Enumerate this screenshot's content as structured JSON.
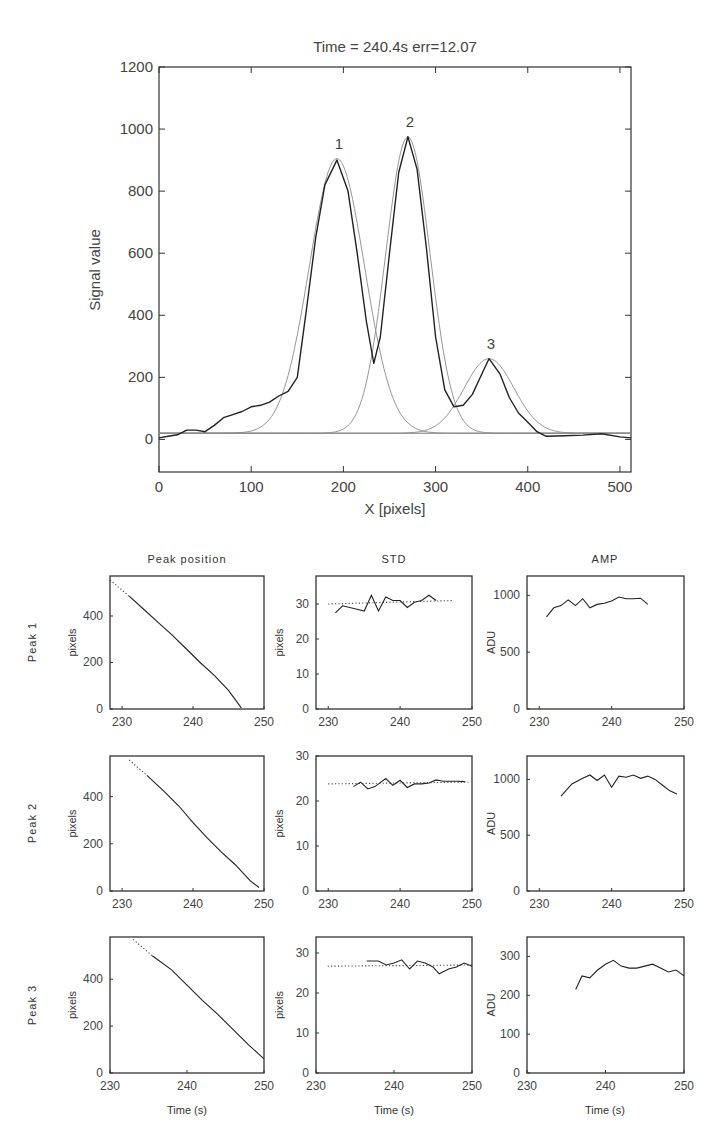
{
  "chart_data": [
    {
      "id": "main",
      "type": "line",
      "title": "Time = 240.4s   err=12.07",
      "xlabel": "X [pixels]",
      "ylabel": "Signal value",
      "xlim": [
        0,
        512
      ],
      "ylim": [
        -105,
        1200
      ],
      "xticks": [
        0,
        100,
        200,
        300,
        400,
        500
      ],
      "yticks": [
        0,
        200,
        400,
        600,
        800,
        1000,
        1200
      ],
      "grid": false,
      "baseline": 20,
      "peaks": [
        {
          "label": "1",
          "center": 193,
          "amplitude": 885,
          "std": 30
        },
        {
          "label": "2",
          "center": 270,
          "amplitude": 955,
          "std": 24
        },
        {
          "label": "3",
          "center": 358,
          "amplitude": 240,
          "std": 27
        }
      ],
      "series": [
        {
          "name": "Measured signal",
          "x": [
            0,
            10,
            20,
            30,
            40,
            50,
            60,
            70,
            80,
            90,
            100,
            110,
            120,
            130,
            140,
            150,
            160,
            170,
            180,
            193,
            205,
            215,
            225,
            233,
            240,
            250,
            260,
            270,
            280,
            290,
            300,
            310,
            320,
            330,
            340,
            350,
            358,
            370,
            380,
            390,
            400,
            410,
            420,
            440,
            460,
            480,
            500,
            512
          ],
          "y": [
            5,
            10,
            15,
            30,
            30,
            25,
            45,
            70,
            80,
            90,
            105,
            110,
            120,
            140,
            155,
            200,
            420,
            650,
            820,
            900,
            800,
            600,
            380,
            245,
            330,
            600,
            860,
            975,
            870,
            620,
            330,
            160,
            105,
            110,
            145,
            210,
            260,
            210,
            135,
            85,
            55,
            25,
            10,
            12,
            14,
            18,
            8,
            5
          ]
        }
      ]
    },
    {
      "id": "r1c1",
      "type": "line",
      "title": "Peak position",
      "row_label": "Peak 1",
      "ylabel": "pixels",
      "xlabel": "",
      "xlim": [
        228.3,
        250
      ],
      "ylim": [
        0,
        572
      ],
      "xticks": [
        230,
        240,
        250
      ],
      "yticks": [
        0,
        200,
        400
      ],
      "series": [
        {
          "name": "dotted",
          "style": "dotted",
          "x": [
            228.3,
            231
          ],
          "y": [
            555,
            485
          ]
        },
        {
          "name": "solid",
          "style": "solid",
          "x": [
            231,
            233,
            235,
            237,
            239,
            241,
            243,
            245,
            246.8
          ],
          "y": [
            485,
            430,
            375,
            320,
            260,
            200,
            145,
            80,
            5
          ]
        }
      ]
    },
    {
      "id": "r1c2",
      "type": "line",
      "title": "STD",
      "ylabel": "pixels",
      "xlabel": "",
      "xlim": [
        228.3,
        250
      ],
      "ylim": [
        0,
        38
      ],
      "xticks": [
        230,
        240,
        250
      ],
      "yticks": [
        0,
        10,
        20,
        30
      ],
      "series": [
        {
          "name": "dotted",
          "style": "dotted",
          "x": [
            230,
            247.5
          ],
          "y": [
            30,
            31
          ]
        },
        {
          "name": "solid",
          "style": "solid",
          "x": [
            231,
            232,
            234,
            235,
            236,
            237,
            238,
            239,
            240,
            241,
            242,
            243,
            244,
            245
          ],
          "y": [
            27.5,
            29.5,
            28.5,
            28,
            32.5,
            28,
            32,
            31,
            31,
            29,
            30.5,
            31,
            32.5,
            31
          ]
        }
      ]
    },
    {
      "id": "r1c3",
      "type": "line",
      "title": "AMP",
      "ylabel": "ADU",
      "xlabel": "",
      "xlim": [
        228.3,
        250
      ],
      "ylim": [
        0,
        1170
      ],
      "xticks": [
        230,
        240,
        250
      ],
      "yticks": [
        0,
        500,
        1000
      ],
      "series": [
        {
          "name": "solid",
          "style": "solid",
          "x": [
            231,
            232,
            233,
            234,
            235,
            236,
            237,
            238,
            239,
            240,
            241,
            242,
            243,
            244,
            245
          ],
          "y": [
            810,
            890,
            910,
            960,
            910,
            970,
            890,
            920,
            930,
            950,
            985,
            970,
            970,
            975,
            920
          ]
        }
      ]
    },
    {
      "id": "r2c1",
      "type": "line",
      "title": "",
      "row_label": "Peak 2",
      "ylabel": "pixels",
      "xlabel": "",
      "xlim": [
        228.3,
        250
      ],
      "ylim": [
        0,
        572
      ],
      "xticks": [
        230,
        240,
        250
      ],
      "yticks": [
        0,
        200,
        400
      ],
      "series": [
        {
          "name": "dotted",
          "style": "dotted",
          "x": [
            231,
            233.5
          ],
          "y": [
            555,
            490
          ]
        },
        {
          "name": "solid",
          "style": "solid",
          "x": [
            233.5,
            236,
            238,
            240,
            242,
            244,
            246,
            248,
            249.3
          ],
          "y": [
            490,
            420,
            360,
            290,
            225,
            165,
            110,
            45,
            15
          ]
        }
      ]
    },
    {
      "id": "r2c2",
      "type": "line",
      "title": "",
      "ylabel": "pixels",
      "xlabel": "",
      "xlim": [
        228.3,
        250
      ],
      "ylim": [
        0,
        30
      ],
      "xticks": [
        230,
        240,
        250
      ],
      "yticks": [
        0,
        10,
        20,
        30
      ],
      "series": [
        {
          "name": "dotted",
          "style": "dotted",
          "x": [
            230,
            249.5
          ],
          "y": [
            23.8,
            24.2
          ]
        },
        {
          "name": "solid",
          "style": "solid",
          "x": [
            233.5,
            234.5,
            235.5,
            236.5,
            238,
            239,
            240,
            241,
            242,
            243,
            244,
            245,
            246,
            247,
            248,
            249
          ],
          "y": [
            23.2,
            24.2,
            22.7,
            23.2,
            25,
            23.5,
            24.6,
            23,
            23.8,
            23.8,
            24,
            24.7,
            24.4,
            24.4,
            24.4,
            24.3
          ]
        }
      ]
    },
    {
      "id": "r2c3",
      "type": "line",
      "title": "",
      "ylabel": "ADU",
      "xlabel": "",
      "xlim": [
        228.3,
        250
      ],
      "ylim": [
        0,
        1210
      ],
      "xticks": [
        230,
        240,
        250
      ],
      "yticks": [
        0,
        500,
        1000
      ],
      "series": [
        {
          "name": "solid",
          "style": "solid",
          "x": [
            233,
            234.5,
            236,
            237,
            238,
            239,
            240,
            241,
            242,
            243,
            244,
            245,
            246,
            247,
            248,
            249
          ],
          "y": [
            850,
            960,
            1010,
            1040,
            990,
            1040,
            930,
            1030,
            1020,
            1040,
            1010,
            1030,
            1000,
            950,
            900,
            870
          ]
        }
      ]
    },
    {
      "id": "r3c1",
      "type": "line",
      "title": "",
      "row_label": "Peak 3",
      "ylabel": "pixels",
      "xlabel": "Time (s)",
      "xlim": [
        230,
        250
      ],
      "ylim": [
        0,
        580
      ],
      "xticks": [
        230,
        240,
        250
      ],
      "yticks": [
        0,
        200,
        400
      ],
      "series": [
        {
          "name": "dotted",
          "style": "dotted",
          "x": [
            233,
            235.5
          ],
          "y": [
            570,
            500
          ]
        },
        {
          "name": "solid",
          "style": "solid",
          "x": [
            235.5,
            238,
            240,
            242,
            244,
            246,
            248,
            250
          ],
          "y": [
            500,
            440,
            375,
            310,
            250,
            185,
            120,
            60
          ]
        }
      ]
    },
    {
      "id": "r3c2",
      "type": "line",
      "title": "",
      "ylabel": "pixels",
      "xlabel": "Time (s)",
      "xlim": [
        230,
        250
      ],
      "ylim": [
        0,
        34
      ],
      "xticks": [
        230,
        240,
        250
      ],
      "yticks": [
        0,
        10,
        20,
        30
      ],
      "series": [
        {
          "name": "dotted",
          "style": "dotted",
          "x": [
            231.5,
            250
          ],
          "y": [
            26.7,
            27
          ]
        },
        {
          "name": "solid",
          "style": "solid",
          "x": [
            236.5,
            238,
            239,
            240,
            241,
            242,
            243,
            244,
            245,
            245.8,
            247,
            248,
            249,
            250
          ],
          "y": [
            28,
            28,
            27,
            27.5,
            28.3,
            26,
            28,
            27.5,
            26.5,
            24.8,
            26,
            26.5,
            27.5,
            26.7
          ]
        }
      ]
    },
    {
      "id": "r3c3",
      "type": "line",
      "title": "",
      "ylabel": "ADU",
      "xlabel": "Time (s)",
      "xlim": [
        230,
        250
      ],
      "ylim": [
        0,
        350
      ],
      "xticks": [
        230,
        240,
        250
      ],
      "yticks": [
        0,
        100,
        200,
        300
      ],
      "series": [
        {
          "name": "solid",
          "style": "solid",
          "x": [
            236.2,
            237,
            238,
            239,
            240,
            241,
            242,
            243,
            244,
            245,
            246,
            247,
            248,
            249,
            250
          ],
          "y": [
            215,
            250,
            245,
            265,
            280,
            290,
            275,
            270,
            270,
            275,
            280,
            270,
            260,
            265,
            250
          ]
        }
      ]
    }
  ],
  "layout_text": {
    "main_title": "Time = 240.4s   err=12.07",
    "main_xlabel": "X [pixels]",
    "main_ylabel": "Signal value",
    "col_titles": [
      "Peak position",
      "STD",
      "AMP"
    ],
    "row_labels": [
      "Peak 1",
      "Peak 2",
      "Peak 3"
    ],
    "time_label": "Time (s)"
  }
}
